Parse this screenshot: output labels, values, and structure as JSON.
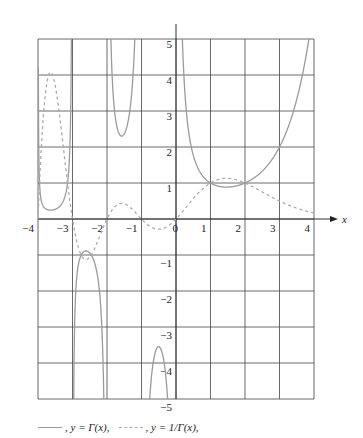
{
  "chart_data": {
    "type": "line",
    "title": "",
    "xlabel": "x",
    "ylabel": "",
    "xlim": [
      -4,
      4
    ],
    "ylim": [
      -5,
      5
    ],
    "grid": true,
    "x_ticks": [
      -4,
      -3,
      -2,
      -1,
      0,
      1,
      2,
      3,
      4
    ],
    "y_ticks": [
      -5,
      -4,
      -3,
      -2,
      -1,
      1,
      2,
      3,
      4,
      5
    ],
    "series": [
      {
        "name": "y = Γ(x)",
        "style": "solid",
        "color": "#9a9a9a",
        "function": "gamma",
        "key_points": [
          [
            -3.5,
            0.27
          ],
          [
            -2.61,
            -0.89
          ],
          [
            -1.5,
            2.36
          ],
          [
            -0.5,
            -3.54
          ],
          [
            0.5,
            1.77
          ],
          [
            1,
            1
          ],
          [
            1.46,
            0.886
          ],
          [
            2,
            1
          ],
          [
            3,
            2
          ],
          [
            4,
            6
          ]
        ]
      },
      {
        "name": "y = 1/Γ(x)",
        "style": "dashed",
        "color": "#aaaaaa",
        "function": "reciprocal_gamma",
        "key_points": [
          [
            -4,
            0
          ],
          [
            -3.8,
            4.2
          ],
          [
            -3,
            0
          ],
          [
            -2.5,
            -1.06
          ],
          [
            -2,
            0
          ],
          [
            -1.4,
            0.64
          ],
          [
            -1,
            0
          ],
          [
            -0.5,
            -0.28
          ],
          [
            0,
            0
          ],
          [
            1,
            1
          ],
          [
            1.46,
            1.13
          ],
          [
            2,
            1
          ],
          [
            3,
            0.5
          ],
          [
            4,
            0.167
          ]
        ]
      }
    ],
    "legend": {
      "position": "bottom",
      "entries": [
        ", y = Γ(x),",
        ", y = 1/Γ(x),"
      ]
    }
  },
  "legend": {
    "gamma": ", y = Γ(x),",
    "recip": ", y = 1/Γ(x),"
  },
  "axis": {
    "x_label": "x"
  }
}
